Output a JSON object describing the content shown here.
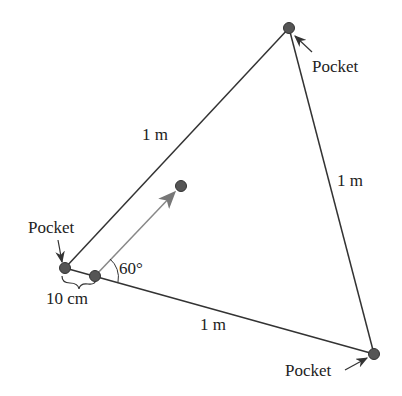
{
  "diagram": {
    "labels": {
      "pocket_top": "Pocket",
      "pocket_left": "Pocket",
      "pocket_bottom": "Pocket",
      "side_left": "1 m",
      "side_right": "1 m",
      "side_bottom": "1 m",
      "distance": "10 cm",
      "angle": "60°"
    },
    "colors": {
      "line": "#333333",
      "ball": "#555555",
      "arrow": "#888888"
    }
  }
}
